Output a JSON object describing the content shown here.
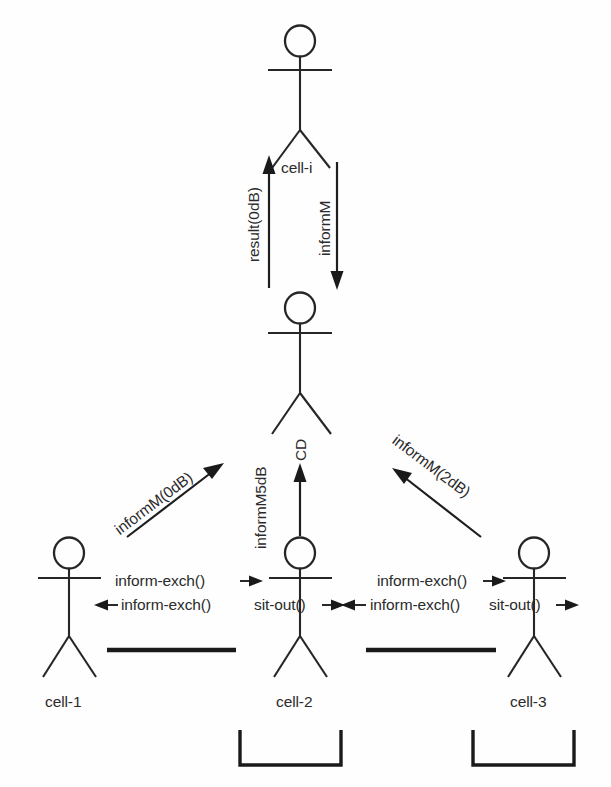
{
  "diagram": {
    "ink_color": "#262626",
    "background_color": "#fefefe",
    "actors": [
      {
        "id": "cell-i",
        "label": "cell-i",
        "role": "top-coordinator"
      },
      {
        "id": "cell-cd",
        "label": "",
        "role": "middle-cd"
      },
      {
        "id": "cell-1",
        "label": "cell-1",
        "role": "bottom-left"
      },
      {
        "id": "cell-2",
        "label": "cell-2",
        "role": "bottom-middle"
      },
      {
        "id": "cell-3",
        "label": "cell-3",
        "role": "bottom-right"
      }
    ],
    "messages": [
      {
        "id": "m1",
        "label": "result(0dB)",
        "from": "cell-cd",
        "to": "cell-i",
        "orientation": "vertical-up"
      },
      {
        "id": "m2",
        "label": "informM",
        "from": "cell-i",
        "to": "cell-cd",
        "orientation": "vertical-down"
      },
      {
        "id": "m3",
        "label": "informM(0dB)",
        "from": "cell-1",
        "to": "cell-cd",
        "orientation": "diagonal-up-right"
      },
      {
        "id": "m4",
        "label": "informM5dB",
        "from": "cell-2",
        "to": "cell-cd",
        "orientation": "vertical-up"
      },
      {
        "id": "m5",
        "label": "CD",
        "from": "cell-2",
        "to": "cell-cd",
        "orientation": "vertical-up"
      },
      {
        "id": "m6",
        "label": "informM(2dB)",
        "from": "cell-3",
        "to": "cell-cd",
        "orientation": "diagonal-up-left"
      },
      {
        "id": "m7",
        "label": "inform-exch()",
        "from": "cell-1",
        "to": "cell-2",
        "orientation": "horizontal-right"
      },
      {
        "id": "m8",
        "label": "inform-exch()",
        "from": "cell-2",
        "to": "cell-1",
        "orientation": "horizontal-left"
      },
      {
        "id": "m9",
        "label": "sit-out()",
        "from": "cell-2",
        "to": "cell-2",
        "orientation": "horizontal-right"
      },
      {
        "id": "m10",
        "label": "inform-exch()",
        "from": "cell-2",
        "to": "cell-3",
        "orientation": "horizontal-right"
      },
      {
        "id": "m11",
        "label": "inform-exch()",
        "from": "cell-3",
        "to": "cell-2",
        "orientation": "horizontal-left"
      },
      {
        "id": "m12",
        "label": "sit-out()",
        "from": "cell-3",
        "to": "cell-3",
        "orientation": "horizontal-right"
      }
    ],
    "bars": [
      {
        "id": "bar-left",
        "between": [
          "cell-1",
          "cell-2"
        ]
      },
      {
        "id": "bar-right",
        "between": [
          "cell-2",
          "cell-3"
        ]
      }
    ],
    "brackets": [
      {
        "id": "bracket-cell-2",
        "under": "cell-2"
      },
      {
        "id": "bracket-cell-3",
        "under": "cell-3"
      }
    ]
  }
}
